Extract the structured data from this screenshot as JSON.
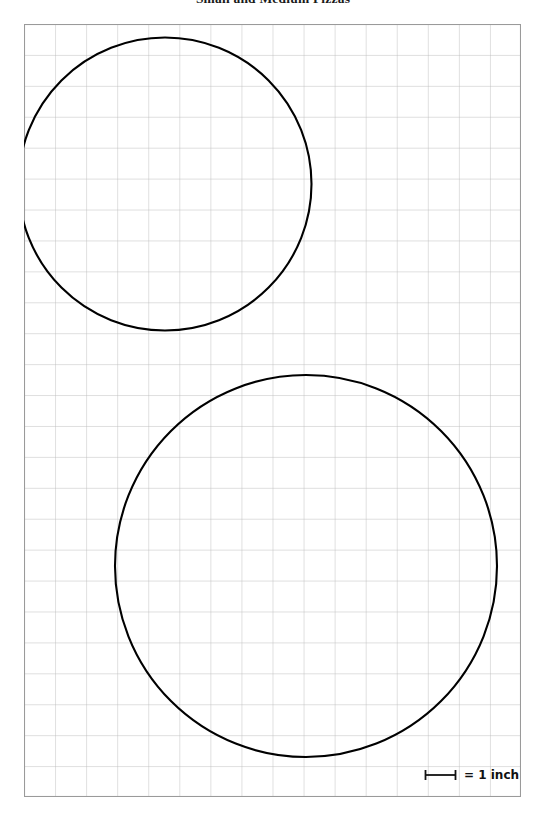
{
  "page": {
    "title": "Small and Medium Pizzas",
    "background_color": "#ffffff"
  },
  "worksheet": {
    "grid": {
      "columns": 16,
      "rows": 25,
      "cell_size_px": 31.06,
      "cell_size_label": "1 inch",
      "line_color": "#b9b9b9",
      "border_color": "#9a9a9a",
      "origin_x_px": 24,
      "origin_y_px": 24,
      "width_px": 497,
      "height_px": 773
    },
    "shapes": [
      {
        "name": "small-pizza-circle",
        "type": "circle",
        "center_x_px": 165,
        "center_y_px": 184,
        "diameter_px": 293,
        "diameter_inches": 9.4,
        "stroke_color": "#000000",
        "stroke_width_px": 2.1,
        "fill": "none"
      },
      {
        "name": "medium-pizza-circle",
        "type": "circle",
        "center_x_px": 306,
        "center_y_px": 566,
        "diameter_px": 382,
        "diameter_inches": 12.3,
        "stroke_color": "#000000",
        "stroke_width_px": 2.1,
        "fill": "none"
      }
    ]
  },
  "legend": {
    "label": "= 1 inch",
    "bar_length_px": 31,
    "bar_color": "#111111"
  }
}
